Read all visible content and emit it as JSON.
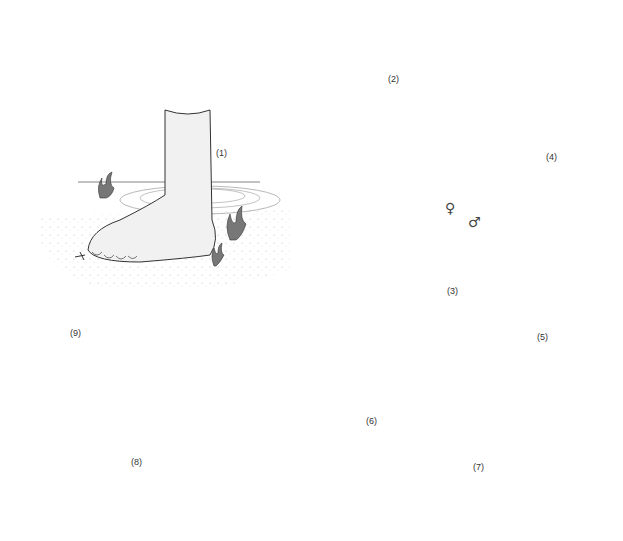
{
  "diagram": {
    "type": "life-cycle",
    "colors": {
      "background": "#ffffff",
      "outline": "#333333",
      "body_fill": "#ececec",
      "organ_fill": "#9a9a9a",
      "dark_fill": "#555555",
      "arrow": "#222222"
    },
    "stages": [
      {
        "id": 1,
        "label": "(1)",
        "depicts": "human foot in water with aquatic plants"
      },
      {
        "id": 2,
        "label": "(2)",
        "depicts": "human torso with internal organs"
      },
      {
        "id": 3,
        "label": "(3)",
        "depicts": "paired adult worms",
        "symbols": [
          "♀",
          "♂"
        ]
      },
      {
        "id": 4,
        "label": "(4)",
        "depicts": "egg / miracidium"
      },
      {
        "id": 5,
        "label": "(5)",
        "depicts": "miracidium larva"
      },
      {
        "id": 6,
        "label": "(6)",
        "depicts": "snail"
      },
      {
        "id": 7,
        "label": "(7)",
        "depicts": "sporocyst with oval germ cells"
      },
      {
        "id": 8,
        "label": "(8)",
        "depicts": "sporocyst with forked-tail cercariae"
      },
      {
        "id": 9,
        "label": "(9)",
        "depicts": "cercaria with forked tail"
      }
    ],
    "arrows": [
      {
        "from": 1,
        "to": 2
      },
      {
        "from": 2,
        "to": 4
      },
      {
        "from": 4,
        "to": 5
      },
      {
        "from": 5,
        "to": 6
      },
      {
        "from": 6,
        "to": 8
      },
      {
        "from": 9,
        "to": 1
      }
    ]
  }
}
